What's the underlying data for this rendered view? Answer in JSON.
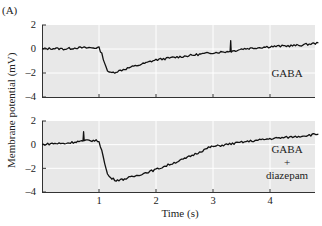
{
  "chart_data": [
    {
      "type": "line",
      "panel": "(A) top",
      "title": "",
      "annotation": "GABA",
      "xlabel": "Time (s)",
      "ylabel": "Membrane potential (mV)",
      "xlim": [
        0,
        4.9
      ],
      "ylim": [
        -4,
        2
      ],
      "yticks": [
        "2",
        "0",
        "-2",
        "-4"
      ],
      "xticks": [
        1,
        2,
        3,
        4
      ],
      "grid": true,
      "series": [
        {
          "name": "GABA",
          "x": [
            0,
            0.2,
            0.4,
            0.6,
            0.8,
            1.0,
            1.05,
            1.1,
            1.15,
            1.2,
            1.3,
            1.5,
            1.8,
            2.0,
            2.5,
            3.0,
            3.3,
            3.31,
            3.32,
            3.5,
            4.0,
            4.5,
            4.85
          ],
          "y": [
            0.0,
            0.05,
            0.0,
            0.1,
            0.1,
            0.1,
            -0.4,
            -1.2,
            -1.8,
            -2.0,
            -1.9,
            -1.6,
            -1.2,
            -0.9,
            -0.6,
            -0.3,
            -0.2,
            0.7,
            -0.2,
            0.0,
            0.2,
            0.3,
            0.5
          ]
        }
      ]
    },
    {
      "type": "line",
      "panel": "(A) bottom",
      "title": "",
      "annotation": "GABA + diazepam",
      "xlabel": "Time (s)",
      "ylabel": "Membrane potential (mV)",
      "xlim": [
        0,
        4.9
      ],
      "ylim": [
        -4,
        2
      ],
      "yticks": [
        "2",
        "0",
        "-2",
        "-4"
      ],
      "xticks": [
        1,
        2,
        3,
        4
      ],
      "grid": true,
      "series": [
        {
          "name": "GABA + diazepam",
          "x": [
            0,
            0.2,
            0.4,
            0.6,
            0.72,
            0.73,
            0.74,
            0.8,
            0.9,
            1.0,
            1.05,
            1.1,
            1.15,
            1.2,
            1.3,
            1.4,
            1.6,
            2.0,
            2.5,
            2.95,
            3.5,
            4.0,
            4.5,
            4.85
          ],
          "y": [
            0.0,
            0.1,
            0.1,
            0.25,
            0.3,
            1.1,
            0.3,
            0.35,
            0.35,
            0.3,
            -0.5,
            -1.6,
            -2.5,
            -2.8,
            -3.0,
            -2.95,
            -2.7,
            -2.1,
            -1.2,
            -0.2,
            0.2,
            0.5,
            0.7,
            0.9
          ]
        }
      ]
    }
  ],
  "figure": {
    "panel_label": "(A)",
    "ylabel": "Membrane potential (mV)",
    "xlabel": "Time (s)",
    "yticks": [
      "2",
      "0",
      "–2",
      "–4"
    ],
    "xticks": [
      "1",
      "2",
      "3",
      "4"
    ],
    "top_annotation": "GABA",
    "bottom_annotation": [
      "GABA",
      "+",
      "diazepam"
    ],
    "colors": {
      "plot_bg": "#e8e8e8",
      "grid": "#ffffff",
      "trace": "#111111",
      "axis": "#333333"
    }
  }
}
